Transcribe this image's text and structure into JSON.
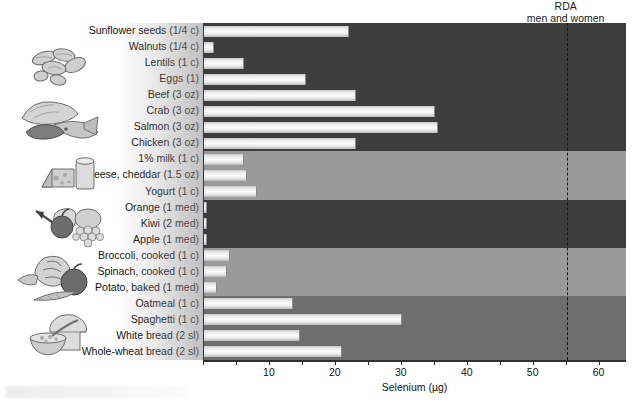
{
  "figure": {
    "annotation_line1": "RDA",
    "annotation_line2": "men and women"
  },
  "axis": {
    "x_title": "Selenium (µg)",
    "x_ticks": [
      0,
      5,
      10,
      15,
      20,
      25,
      30,
      35,
      40,
      45,
      50,
      55,
      60
    ],
    "x_tick_labels": [
      "",
      "",
      "10",
      "",
      "20",
      "",
      "30",
      "",
      "40",
      "",
      "50",
      "",
      "60"
    ],
    "x_min": 0,
    "x_max": 64
  },
  "reference": {
    "label": "RDA men and women",
    "value": 55
  },
  "groups": [
    {
      "name": "protein-foods",
      "shade": "dark",
      "icons": [
        "nuts-icon",
        "meat-fish-icon"
      ]
    },
    {
      "name": "dairy-foods",
      "shade": "light",
      "icons": [
        "cheese-milk-icon"
      ]
    },
    {
      "name": "fruits",
      "shade": "dark",
      "icons": [
        "fruit-icon"
      ]
    },
    {
      "name": "vegetables",
      "shade": "light",
      "icons": [
        "vegetables-icon"
      ]
    },
    {
      "name": "grains",
      "shade": "mid",
      "icons": [
        "bread-cereal-icon"
      ]
    }
  ],
  "chart_data": {
    "type": "bar",
    "orientation": "horizontal",
    "title": "",
    "xlabel": "Selenium (µg)",
    "ylabel": "",
    "xlim": [
      0,
      64
    ],
    "grid": false,
    "legend": "none",
    "reference_line": {
      "label": "RDA men and women",
      "value": 55,
      "style": "dashed"
    },
    "categories": [
      "Sunflower seeds (1/4 c)",
      "Walnuts (1/4 c)",
      "Lentils (1 c)",
      "Eggs (1)",
      "Beef (3 oz)",
      "Crab (3 oz)",
      "Salmon (3 oz)",
      "Chicken (3 oz)",
      "1% milk (1 c)",
      "Cheese, cheddar (1.5 oz)",
      "Yogurt (1 c)",
      "Orange (1 med)",
      "Kiwi (2 med)",
      "Apple (1 med)",
      "Broccoli, cooked (1 c)",
      "Spinach, cooked (1 c)",
      "Potato, baked (1 med)",
      "Oatmeal (1 c)",
      "Spaghetti (1 c)",
      "White bread (2 sl)",
      "Whole-wheat bread (2 sl)"
    ],
    "values": [
      22,
      1.5,
      6,
      15.5,
      23,
      35,
      35.5,
      23,
      6,
      6.5,
      8,
      0.5,
      0.5,
      0.5,
      4,
      3.5,
      2,
      13.5,
      30,
      14.5,
      21
    ],
    "group_of": [
      "protein-foods",
      "protein-foods",
      "protein-foods",
      "protein-foods",
      "protein-foods",
      "protein-foods",
      "protein-foods",
      "protein-foods",
      "dairy-foods",
      "dairy-foods",
      "dairy-foods",
      "fruits",
      "fruits",
      "fruits",
      "vegetables",
      "vegetables",
      "vegetables",
      "grains",
      "grains",
      "grains",
      "grains"
    ]
  },
  "colors": {
    "band_dark": "#3d3d3d",
    "band_light": "#9a9a9a",
    "band_mid": "#6e6e6e",
    "bar_fill": "#f2f2f2",
    "axis": "#2f2f2f",
    "reference_line": "#161616",
    "text": "#111111",
    "background": "#ffffff"
  }
}
